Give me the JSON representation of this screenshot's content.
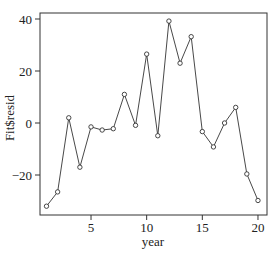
{
  "chart_data": {
    "type": "line",
    "title": "",
    "xlabel": "year",
    "ylabel": "Fit$resid",
    "x": [
      1,
      2,
      3,
      4,
      5,
      6,
      7,
      8,
      9,
      10,
      11,
      12,
      13,
      14,
      15,
      16,
      17,
      18,
      19,
      20
    ],
    "values": [
      -32,
      -26.5,
      2,
      -17,
      -1.5,
      -2.7,
      -2.2,
      11,
      -0.9,
      26.5,
      -4.9,
      39.2,
      23,
      33.2,
      -3.3,
      -9.2,
      0,
      6,
      -19.6,
      -29.8
    ],
    "xticks": [
      5,
      10,
      15,
      20
    ],
    "yticks": [
      -20,
      0,
      20,
      40
    ],
    "xlim": [
      0.5,
      20.7
    ],
    "ylim": [
      -35.5,
      41.5
    ],
    "markers": "open-circle",
    "grid": false,
    "legend": null
  },
  "axes": {
    "xlabel": "year",
    "ylabel": "Fit$resid",
    "xtick_labels": [
      "5",
      "10",
      "15",
      "20"
    ],
    "ytick_labels": [
      "-20",
      "0",
      "20",
      "40"
    ]
  }
}
